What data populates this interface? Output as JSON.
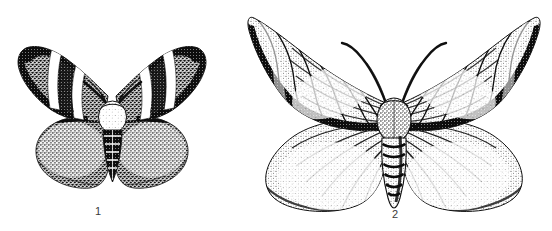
{
  "plate": {
    "name": "moth-plate",
    "description": "Black and white stipple engraving of two moths shown dorsally with wings spread",
    "background_color": "#ffffff",
    "ink_color": "#111111",
    "label_color": "#3a3a3a",
    "width": 552,
    "height": 231
  },
  "figures": [
    {
      "id": "figure-1",
      "label": "1",
      "subject": "moth",
      "label_position": {
        "x": 98,
        "y": 205
      },
      "bounds": {
        "x": 14,
        "y": 45,
        "width": 196,
        "height": 150
      },
      "center_x": 112,
      "features": {
        "forewing_pattern": "dark stippled ground with two pale oblique bands",
        "hindwing_pattern": "uniformly stippled rounded lobes",
        "body": "stout pale thorax with banded dark abdomen",
        "antennae": "short, curved, diverging"
      }
    },
    {
      "id": "figure-2",
      "label": "2",
      "subject": "moth",
      "label_position": {
        "x": 395,
        "y": 208
      },
      "bounds": {
        "x": 248,
        "y": 10,
        "width": 292,
        "height": 205
      },
      "center_x": 394,
      "features": {
        "forewing_pattern": "pale stippled ground crossed by dark wavy transverse lines and dark veins",
        "hindwing_pattern": "broad rounded lobes with radiating veins and fringed margin",
        "body": "elongate abdomen with dark segment bands",
        "antennae": "long, slender, outward curving"
      }
    }
  ]
}
